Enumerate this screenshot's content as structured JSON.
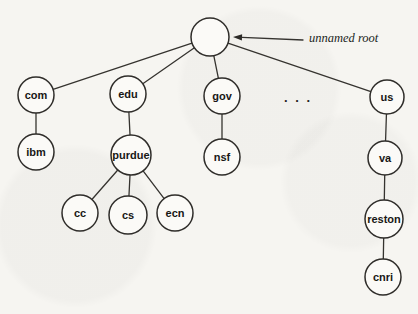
{
  "figure": {
    "background": "#f6f5f1",
    "stroke_color": "#2f2d2a",
    "node_fill": "#fbfaf7",
    "label_color": "#181715"
  },
  "tree": {
    "nodes": [
      {
        "id": "root",
        "label": "",
        "x": 210,
        "y": 37,
        "r": 19
      },
      {
        "id": "com",
        "label": "com",
        "x": 36,
        "y": 95,
        "r": 18
      },
      {
        "id": "edu",
        "label": "edu",
        "x": 128,
        "y": 94,
        "r": 18
      },
      {
        "id": "gov",
        "label": "gov",
        "x": 222,
        "y": 96,
        "r": 18
      },
      {
        "id": "us",
        "label": "us",
        "x": 387,
        "y": 97,
        "r": 17
      },
      {
        "id": "ibm",
        "label": "ibm",
        "x": 36,
        "y": 152,
        "r": 18
      },
      {
        "id": "purdue",
        "label": "purdue",
        "x": 131,
        "y": 155,
        "r": 20
      },
      {
        "id": "nsf",
        "label": "nsf",
        "x": 222,
        "y": 157,
        "r": 18
      },
      {
        "id": "va",
        "label": "va",
        "x": 385,
        "y": 158,
        "r": 17
      },
      {
        "id": "cc",
        "label": "cc",
        "x": 80,
        "y": 213,
        "r": 18
      },
      {
        "id": "cs",
        "label": "cs",
        "x": 128,
        "y": 215,
        "r": 19
      },
      {
        "id": "ecn",
        "label": "ecn",
        "x": 175,
        "y": 213,
        "r": 18
      },
      {
        "id": "reston",
        "label": "reston",
        "x": 384,
        "y": 219,
        "r": 19
      },
      {
        "id": "cnri",
        "label": "cnri",
        "x": 383,
        "y": 277,
        "r": 18
      }
    ],
    "edges": [
      [
        "root",
        "com"
      ],
      [
        "root",
        "edu"
      ],
      [
        "root",
        "gov"
      ],
      [
        "root",
        "us"
      ],
      [
        "com",
        "ibm"
      ],
      [
        "edu",
        "purdue"
      ],
      [
        "gov",
        "nsf"
      ],
      [
        "us",
        "va"
      ],
      [
        "purdue",
        "cc"
      ],
      [
        "purdue",
        "cs"
      ],
      [
        "purdue",
        "ecn"
      ],
      [
        "va",
        "reston"
      ],
      [
        "reston",
        "cnri"
      ]
    ],
    "ellipsis": {
      "text": ". . .",
      "x": 298,
      "y": 102
    },
    "annotation": {
      "label": "unnamed root",
      "label_x": 309,
      "label_y": 42,
      "arrow_tip_x": 233,
      "arrow_tip_y": 37,
      "arrow_tail_x": 303,
      "arrow_tail_y": 40
    }
  }
}
